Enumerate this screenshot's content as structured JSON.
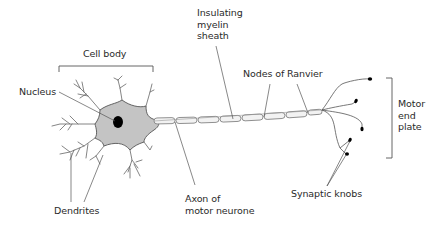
{
  "diagram": {
    "title": "Motor neurone",
    "labels": {
      "cell_body": "Cell body",
      "nucleus": "Nucleus",
      "insulating_myelin_sheath": "Insulating\nmyelin\nsheath",
      "nodes_of_ranvier": "Nodes of Ranvier",
      "motor_end_plate": "Motor\nend\nplate",
      "dendrites": "Dendrites",
      "axon_of_motor_neurone": "Axon of\nmotor neurone",
      "synaptic_knobs": "Synaptic knobs"
    },
    "colors": {
      "cell_body_fill": "#c4c4c4",
      "outline": "#555555",
      "nucleus": "#000000",
      "text": "#2a2a2a",
      "background": "#ffffff"
    }
  }
}
